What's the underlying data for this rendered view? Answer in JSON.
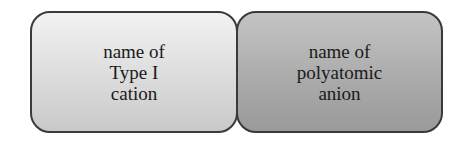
{
  "diagram": {
    "boxes": [
      {
        "lines": [
          "name of",
          "Type I",
          "cation"
        ],
        "fill": "#dcdcdc"
      },
      {
        "lines": [
          "name of",
          "polyatomic",
          "anion"
        ],
        "fill": "#a9a9a9"
      }
    ]
  }
}
